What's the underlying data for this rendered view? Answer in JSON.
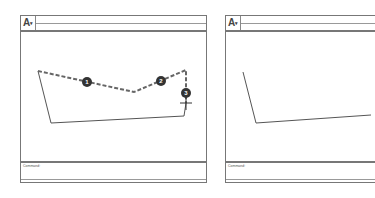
{
  "windows": [
    {
      "id": "before",
      "app_button": {
        "label": "A",
        "dropdown": "▾"
      },
      "command_label": "Command:",
      "selection_markers": [
        "1",
        "2",
        "3"
      ],
      "pick_cursor": "crosshair"
    },
    {
      "id": "after",
      "app_button": {
        "label": "A",
        "dropdown": "▾"
      },
      "command_label": "Command:"
    }
  ],
  "colors": {
    "line": "#555555",
    "selected_dash": "#666666",
    "badge": "#333333"
  }
}
